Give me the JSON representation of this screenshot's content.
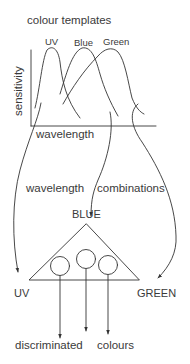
{
  "diagram": {
    "title": "colour  templates",
    "chart": {
      "y_axis_label": "sensitivity",
      "x_axis_label": "wavelength",
      "curves": [
        {
          "label": "UV"
        },
        {
          "label": "Blue"
        },
        {
          "label": "Green"
        }
      ]
    },
    "middle_label": {
      "left": "wavelength",
      "right": "combinations"
    },
    "triangle": {
      "top": "BLUE",
      "left": "UV",
      "right": "GREEN",
      "circles": 3
    },
    "bottom_label": {
      "left": "discriminated",
      "right": "colours"
    },
    "colors": {
      "line": "#333333",
      "text": "#3a3a3a",
      "background": "#ffffff"
    }
  }
}
